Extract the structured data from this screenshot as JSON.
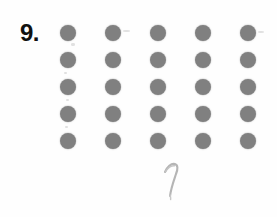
{
  "page": {
    "background_color": "#ffffff",
    "width": 277,
    "height": 217,
    "kind": "scanned-worksheet-page"
  },
  "problem": {
    "number_label": "9.",
    "prompt_text": ""
  },
  "dot_array": {
    "description": "5 by 5 array of grey dots",
    "rows": 5,
    "columns": 5,
    "total_dots": 25,
    "dot_color": "#8b8b8b",
    "dot_diameter_px": 16,
    "column_spacing_px": 45,
    "row_spacing_px": 27,
    "first_dot_center_x": 68,
    "first_dot_center_y": 32,
    "grid": [
      [
        1,
        1,
        1,
        1,
        1
      ],
      [
        1,
        1,
        1,
        1,
        1
      ],
      [
        1,
        1,
        1,
        1,
        1
      ],
      [
        1,
        1,
        1,
        1,
        1
      ],
      [
        1,
        1,
        1,
        1,
        1
      ]
    ],
    "row_labels": [
      "row-1",
      "row-2",
      "row-3",
      "row-4",
      "row-5"
    ],
    "column_labels": [
      "col-1",
      "col-2",
      "col-3",
      "col-4",
      "col-5"
    ]
  },
  "handwritten_answer": {
    "value": "1",
    "color": "#9a9a9a",
    "style": "faint pencil stroke",
    "position_x": 157,
    "position_y": 160
  },
  "stray_marks": [
    {
      "name": "mark-right-of-row1-col2",
      "x": 123,
      "y": 30,
      "w": 7,
      "h": 2
    },
    {
      "name": "mark-below-row1-col1",
      "x": 71,
      "y": 43,
      "w": 4,
      "h": 3
    },
    {
      "name": "mark-below-row2-col1",
      "x": 64,
      "y": 72,
      "w": 3,
      "h": 2
    },
    {
      "name": "mark-below-row3-col1",
      "x": 66,
      "y": 99,
      "w": 3,
      "h": 2
    },
    {
      "name": "mark-below-row4-col1",
      "x": 65,
      "y": 126,
      "w": 3,
      "h": 2
    },
    {
      "name": "mark-right-of-row1-col5",
      "x": 258,
      "y": 31,
      "w": 6,
      "h": 2
    }
  ]
}
